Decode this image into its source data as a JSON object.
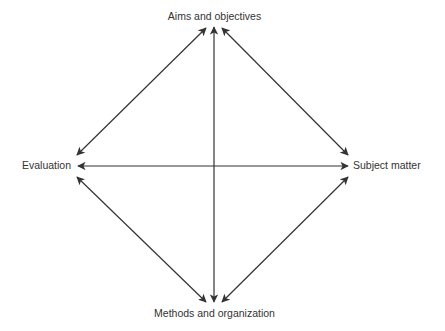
{
  "diagram": {
    "nodes": {
      "top": "Aims and objectives",
      "left": "Evaluation",
      "right": "Subject matter",
      "bottom": "Methods and organization"
    },
    "edges": [
      {
        "from": "Aims and objectives",
        "to": "Evaluation",
        "style": "double-headed arrow"
      },
      {
        "from": "Aims and objectives",
        "to": "Subject matter",
        "style": "double-headed arrow"
      },
      {
        "from": "Aims and objectives",
        "to": "Methods and organization",
        "style": "double-headed arrow"
      },
      {
        "from": "Evaluation",
        "to": "Subject matter",
        "style": "double-headed arrow"
      },
      {
        "from": "Evaluation",
        "to": "Methods and organization",
        "style": "double-headed arrow"
      },
      {
        "from": "Subject matter",
        "to": "Methods and organization",
        "style": "double-headed arrow"
      }
    ],
    "colors": {
      "line": "#333333",
      "text": "#333333",
      "background": "#ffffff"
    }
  }
}
